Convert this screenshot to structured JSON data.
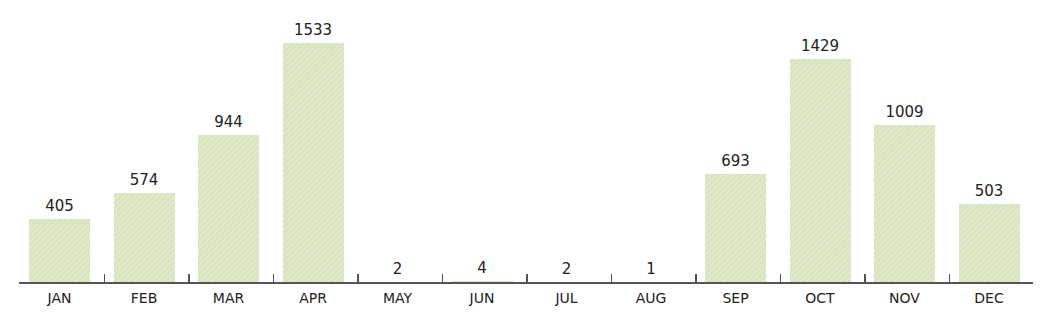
{
  "chart_data": {
    "type": "bar",
    "title": "",
    "xlabel": "",
    "ylabel": "",
    "categories": [
      "JAN",
      "FEB",
      "MAR",
      "APR",
      "MAY",
      "JUN",
      "JUL",
      "AUG",
      "SEP",
      "OCT",
      "NOV",
      "DEC"
    ],
    "values": [
      405,
      574,
      944,
      1533,
      2,
      4,
      2,
      1,
      693,
      1429,
      1009,
      503
    ],
    "ylim": [
      0,
      1533
    ],
    "grid": false,
    "legend": null,
    "data_labels": true,
    "bar_color": "#d9e4bf",
    "axis_color": "#555555"
  }
}
